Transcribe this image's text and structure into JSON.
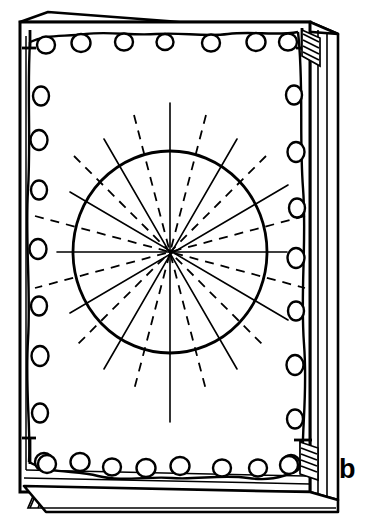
{
  "figure": {
    "label": "b",
    "caption_letter": "b",
    "background_color": "#ffffff",
    "stroke_color": "#000000"
  },
  "canvas": {
    "width": 376,
    "height": 531
  },
  "plate": {
    "name": "perforated-plate",
    "outer_frame": {
      "x": 20,
      "y": 22,
      "width": 290,
      "height": 470
    },
    "inner_frame": {
      "x": 30,
      "y": 32,
      "width": 268,
      "height": 448
    },
    "depth_offset_x": 28,
    "depth_offset_y": -12,
    "hole_radius": 8.5,
    "hole_counts": {
      "top": 7,
      "bottom": 8,
      "left": 9,
      "right": 9
    },
    "corner_brackets": [
      "top-left",
      "top-right",
      "bottom-left",
      "bottom-right"
    ],
    "hatched_feet": [
      "bottom-left",
      "bottom-right"
    ],
    "hatched_edge": [
      "top-right",
      "bottom-right"
    ]
  },
  "holes": {
    "top": [
      {
        "cx": 46,
        "cy": 45
      },
      {
        "cx": 80,
        "cy": 43
      },
      {
        "cx": 124,
        "cy": 42
      },
      {
        "cx": 165,
        "cy": 42
      },
      {
        "cx": 211,
        "cy": 43
      },
      {
        "cx": 256,
        "cy": 42
      },
      {
        "cx": 288,
        "cy": 42
      }
    ],
    "left": [
      {
        "cx": 39,
        "cy": 44
      },
      {
        "cx": 39,
        "cy": 94
      },
      {
        "cx": 39,
        "cy": 140
      },
      {
        "cx": 39,
        "cy": 190
      },
      {
        "cx": 39,
        "cy": 250
      },
      {
        "cx": 39,
        "cy": 308
      },
      {
        "cx": 39,
        "cy": 357
      },
      {
        "cx": 39,
        "cy": 411
      },
      {
        "cx": 42,
        "cy": 462
      }
    ],
    "right": [
      {
        "cx": 293,
        "cy": 44
      },
      {
        "cx": 295,
        "cy": 95
      },
      {
        "cx": 296,
        "cy": 152
      },
      {
        "cx": 297,
        "cy": 206
      },
      {
        "cx": 296,
        "cy": 258
      },
      {
        "cx": 296,
        "cy": 311
      },
      {
        "cx": 295,
        "cy": 365
      },
      {
        "cx": 295,
        "cy": 419
      },
      {
        "cx": 293,
        "cy": 464
      }
    ],
    "bottom": [
      {
        "cx": 46,
        "cy": 465
      },
      {
        "cx": 80,
        "cy": 464
      },
      {
        "cx": 112,
        "cy": 468
      },
      {
        "cx": 147,
        "cy": 468
      },
      {
        "cx": 180,
        "cy": 466
      },
      {
        "cx": 222,
        "cy": 468
      },
      {
        "cx": 258,
        "cy": 468
      },
      {
        "cx": 289,
        "cy": 466
      }
    ]
  },
  "radial_diagram": {
    "name": "radial-line-diagram",
    "center": {
      "x": 170,
      "y": 252
    },
    "circle_radius_x": 97,
    "circle_radius_y": 101,
    "circle_stroke_width": 2.6,
    "solid_lines": [
      {
        "angle_deg": 0,
        "length": 137,
        "label": "horizontal-axis"
      },
      {
        "angle_deg": 90,
        "length": 152,
        "label": "vertical-axis"
      },
      {
        "angle_deg": 30,
        "length": 136,
        "label": "solid-ray-30"
      },
      {
        "angle_deg": 60,
        "length": 132,
        "label": "solid-ray-60"
      },
      {
        "angle_deg": 120,
        "length": 132,
        "label": "solid-ray-120"
      },
      {
        "angle_deg": 150,
        "length": 136,
        "label": "solid-ray-150"
      }
    ],
    "dashed_lines": [
      {
        "angle_deg": 15,
        "length": 140,
        "label": "dashed-ray-15"
      },
      {
        "angle_deg": 45,
        "length": 136,
        "label": "dashed-ray-45"
      },
      {
        "angle_deg": 75,
        "length": 142,
        "label": "dashed-ray-75"
      },
      {
        "angle_deg": 105,
        "length": 142,
        "label": "dashed-ray-105"
      },
      {
        "angle_deg": 135,
        "length": 136,
        "label": "dashed-ray-135"
      },
      {
        "angle_deg": 165,
        "length": 140,
        "label": "dashed-ray-165"
      }
    ],
    "dash_pattern": "9 7",
    "line_stroke_width": 1.5,
    "solid_line_count": 6,
    "dashed_line_count": 6,
    "total_ray_count": 24
  }
}
